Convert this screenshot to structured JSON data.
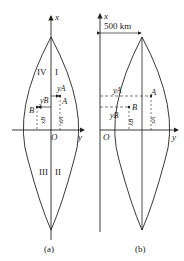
{
  "figure_a": {
    "caption": "(a)",
    "axis_x": "x",
    "axis_y": "y",
    "origin": "O",
    "quadrants": [
      "I",
      "II",
      "III",
      "IV"
    ],
    "point_a": "A",
    "point_b": "B",
    "ya": "yA",
    "yb": "yB",
    "xa": "xA",
    "xb": "xB"
  },
  "figure_b": {
    "caption": "(b)",
    "axis_x": "x",
    "axis_y": "y",
    "origin": "O",
    "offset_label": "500 km",
    "point_a": "A",
    "point_b": "B",
    "ya": "yA",
    "yb": "yB",
    "xa": "xA",
    "xb": "xB"
  },
  "colors": {
    "line": "#222222",
    "background": "#ffffff"
  }
}
